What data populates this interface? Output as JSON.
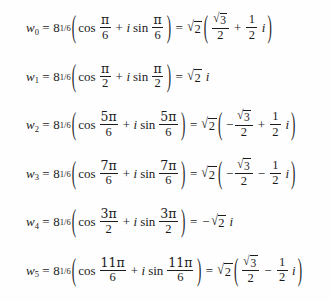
{
  "document": {
    "type": "math-equation-list",
    "description": "Sixth roots of a complex number expressed in polar and rectangular form",
    "text_color": "#1b1b1b",
    "background_color": "#fefefe"
  },
  "symbols": {
    "variable": "w",
    "equals": "=",
    "plus": "+",
    "minus": "−",
    "imaginary_unit": "i",
    "pi": "π",
    "cos": "cos",
    "sin": "sin",
    "radical": "√",
    "paren_open": "(",
    "paren_close": ")",
    "base": "8",
    "exponent": "1/6",
    "modulus_radicand": "2",
    "sqrt3_radicand": "3"
  },
  "equations": [
    {
      "index": "0",
      "lhs_variable": "w",
      "lhs_subscript": "0",
      "base": "8",
      "exponent": "1/6",
      "angle_numerator": "π",
      "angle_denominator": "6",
      "rhs_modulus_radicand": "2",
      "rhs_real_sign": "",
      "rhs_real_num": "√3",
      "rhs_real_den": "2",
      "rhs_operator": "+",
      "rhs_imag_num": "1",
      "rhs_imag_den": "2",
      "rhs_form": "full"
    },
    {
      "index": "1",
      "lhs_variable": "w",
      "lhs_subscript": "1",
      "base": "8",
      "exponent": "1/6",
      "angle_numerator": "π",
      "angle_denominator": "2",
      "rhs_modulus_radicand": "2",
      "rhs_simple_sign": "",
      "rhs_form": "pure-imaginary"
    },
    {
      "index": "2",
      "lhs_variable": "w",
      "lhs_subscript": "2",
      "base": "8",
      "exponent": "1/6",
      "angle_numerator": "5π",
      "angle_denominator": "6",
      "rhs_modulus_radicand": "2",
      "rhs_real_sign": "−",
      "rhs_real_num": "√3",
      "rhs_real_den": "2",
      "rhs_operator": "+",
      "rhs_imag_num": "1",
      "rhs_imag_den": "2",
      "rhs_form": "full"
    },
    {
      "index": "3",
      "lhs_variable": "w",
      "lhs_subscript": "3",
      "base": "8",
      "exponent": "1/6",
      "angle_numerator": "7π",
      "angle_denominator": "6",
      "rhs_modulus_radicand": "2",
      "rhs_real_sign": "−",
      "rhs_real_num": "√3",
      "rhs_real_den": "2",
      "rhs_operator": "−",
      "rhs_imag_num": "1",
      "rhs_imag_den": "2",
      "rhs_form": "full"
    },
    {
      "index": "4",
      "lhs_variable": "w",
      "lhs_subscript": "4",
      "base": "8",
      "exponent": "1/6",
      "angle_numerator": "3π",
      "angle_denominator": "2",
      "rhs_modulus_radicand": "2",
      "rhs_simple_sign": "−",
      "rhs_form": "pure-imaginary"
    },
    {
      "index": "5",
      "lhs_variable": "w",
      "lhs_subscript": "5",
      "base": "8",
      "exponent": "1/6",
      "angle_numerator": "11π",
      "angle_denominator": "6",
      "rhs_modulus_radicand": "2",
      "rhs_real_sign": "",
      "rhs_real_num": "√3",
      "rhs_real_den": "2",
      "rhs_operator": "−",
      "rhs_imag_num": "1",
      "rhs_imag_den": "2",
      "rhs_form": "full"
    }
  ]
}
